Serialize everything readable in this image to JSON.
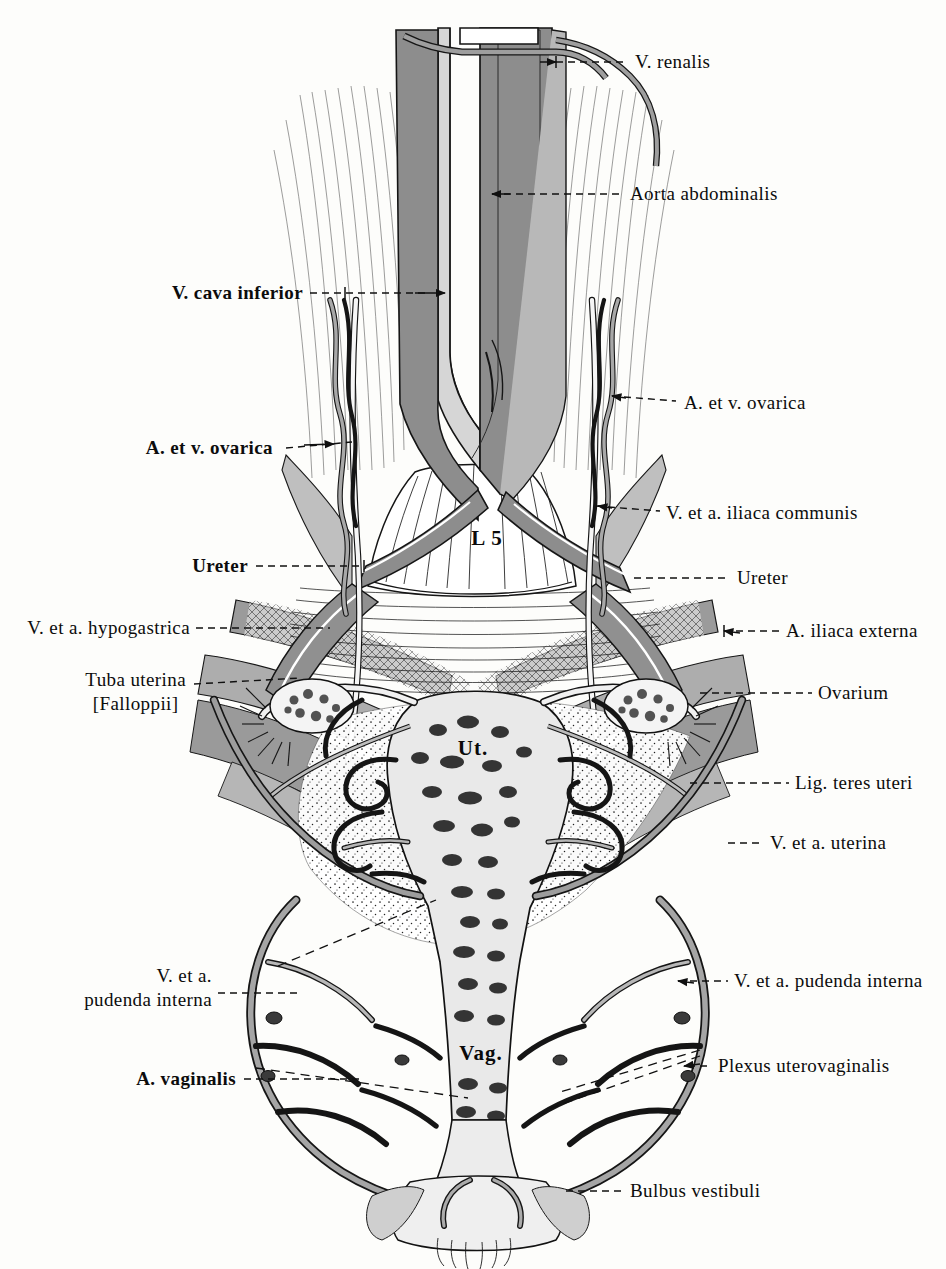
{
  "figure": {
    "background_color": "#fdfdfb",
    "ink_color": "#101010",
    "mid_tone": "#8e8e8e",
    "light_tone": "#c4c4c4"
  },
  "inline_labels": [
    {
      "name": "vertebra-l5",
      "text": "L 5",
      "x": 487,
      "y": 538
    },
    {
      "name": "uterus",
      "text": "Ut.",
      "x": 473,
      "y": 748
    },
    {
      "name": "vagina",
      "text": "Vag.",
      "x": 481,
      "y": 1053
    }
  ],
  "leader_labels": [
    {
      "name": "v-renalis",
      "text": "V. renalis",
      "side": "right",
      "x": 635,
      "y": 62,
      "bold": false
    },
    {
      "name": "aorta-abdominalis",
      "text": "Aorta abdominalis",
      "side": "right",
      "x": 630,
      "y": 194,
      "bold": false
    },
    {
      "name": "v-cava-inferior",
      "text": "V. cava inferior",
      "side": "left",
      "x": 303,
      "y": 293,
      "bold": true
    },
    {
      "name": "a-et-v-ovarica-right",
      "text": "A. et v. ovarica",
      "side": "right",
      "x": 684,
      "y": 403,
      "bold": false
    },
    {
      "name": "a-et-v-ovarica-left",
      "text": "A. et v. ovarica",
      "side": "left",
      "x": 273,
      "y": 448,
      "bold": true
    },
    {
      "name": "v-et-a-iliaca-communis",
      "text": "V. et a. iliaca communis",
      "side": "right",
      "x": 666,
      "y": 513,
      "bold": false
    },
    {
      "name": "ureter-left",
      "text": "Ureter",
      "side": "left",
      "x": 248,
      "y": 566,
      "bold": true
    },
    {
      "name": "ureter-right",
      "text": "Ureter",
      "side": "right",
      "x": 737,
      "y": 578,
      "bold": false
    },
    {
      "name": "v-et-a-hypogastrica",
      "text": "V. et a. hypogastrica",
      "side": "left",
      "x": 190,
      "y": 628,
      "bold": false
    },
    {
      "name": "a-iliaca-externa",
      "text": "A. iliaca externa",
      "side": "right",
      "x": 786,
      "y": 631,
      "bold": false
    },
    {
      "name": "ovarium",
      "text": "Ovarium",
      "side": "right",
      "x": 818,
      "y": 693,
      "bold": false
    },
    {
      "name": "lig-teres-uteri",
      "text": "Lig. teres uteri",
      "side": "right",
      "x": 795,
      "y": 783,
      "bold": false
    },
    {
      "name": "v-et-a-uterina",
      "text": "V. et a. uterina",
      "side": "right",
      "x": 770,
      "y": 843,
      "bold": false
    },
    {
      "name": "v-et-a-pudenda-interna-right",
      "text": "V. et a. pudenda interna",
      "side": "right",
      "x": 734,
      "y": 981,
      "bold": false
    },
    {
      "name": "plexus-uterovaginalis",
      "text": "Plexus uterovaginalis",
      "side": "right",
      "x": 718,
      "y": 1066,
      "bold": false
    },
    {
      "name": "bulbus-vestibuli",
      "text": "Bulbus vestibuli",
      "side": "right",
      "x": 630,
      "y": 1191,
      "bold": false
    }
  ],
  "leader_labels_multiline": [
    {
      "name": "tuba-uterina",
      "line1": "Tuba uterina",
      "line2": "[Falloppii]",
      "side": "left",
      "x": 186,
      "y": 684,
      "style": "center2"
    },
    {
      "name": "v-et-a-pudenda-interna-left",
      "line1": "V. et a.",
      "line2": "pudenda interna",
      "side": "left",
      "x": 212,
      "y": 980,
      "style": "indent2"
    }
  ],
  "leader_labels_single_bold": [
    {
      "name": "a-vaginalis",
      "text": "A. vaginalis",
      "side": "left",
      "x": 236,
      "y": 1079
    }
  ],
  "anatomy_structures": [
    "abdominal aorta",
    "inferior vena cava",
    "renal vein",
    "ovarian artery and vein",
    "common iliac vessels",
    "external iliac artery",
    "hypogastric vessels",
    "ureters",
    "uterine tube",
    "ovary",
    "round ligament of uterus",
    "uterine artery and vein",
    "internal pudendal vessels",
    "vaginal artery",
    "uterovaginal plexus",
    "bulb of vestibule",
    "fifth lumbar vertebra",
    "uterus",
    "vagina"
  ]
}
